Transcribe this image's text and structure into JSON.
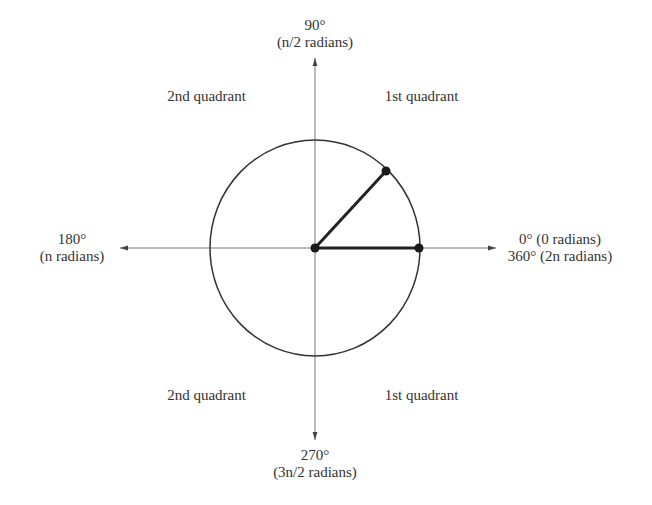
{
  "diagram": {
    "colors": {
      "axis": "#777777",
      "circle": "#333333",
      "radius": "#222222",
      "point": "#1a1a1a",
      "text": "#333333",
      "background": "#ffffff"
    },
    "geometry": {
      "center": [
        315,
        248
      ],
      "rx": 105,
      "ry": 108,
      "axis_x": [
        120,
        496
      ],
      "axis_y": [
        58,
        440
      ],
      "points": [
        {
          "name": "center",
          "x": 315,
          "y": 248
        },
        {
          "name": "angle-0",
          "x": 419,
          "y": 248
        },
        {
          "name": "angle-point",
          "x": 386,
          "y": 171
        }
      ]
    },
    "labels": {
      "top_deg": "90°",
      "top_rad": "(n/2 radians)",
      "left_deg": "180°",
      "left_rad": "(n radians)",
      "right_line1": "0° (0 radians)",
      "right_line2": "360° (2n radians)",
      "bottom_deg": "270°",
      "bottom_rad": "(3n/2 radians)"
    },
    "quadrants": {
      "upper_left": "2nd quadrant",
      "upper_right": "1st quadrant",
      "lower_left": "2nd quadrant",
      "lower_right": "1st quadrant"
    }
  }
}
